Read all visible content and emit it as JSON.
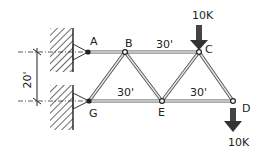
{
  "diagram": {
    "type": "truss",
    "nodes": {
      "A": {
        "label": "A"
      },
      "B": {
        "label": "B"
      },
      "C": {
        "label": "C"
      },
      "D": {
        "label": "D"
      },
      "E": {
        "label": "E"
      },
      "G": {
        "label": "G"
      }
    },
    "dimensions": {
      "top_span": "30'",
      "bottom_span_left": "30'",
      "bottom_span_right": "30'",
      "height": "20'"
    },
    "loads": {
      "at_C": "10K",
      "at_D": "10K"
    },
    "colors": {
      "line": "#333333",
      "member": "#9a9a9a",
      "hatch": "#444444"
    }
  }
}
